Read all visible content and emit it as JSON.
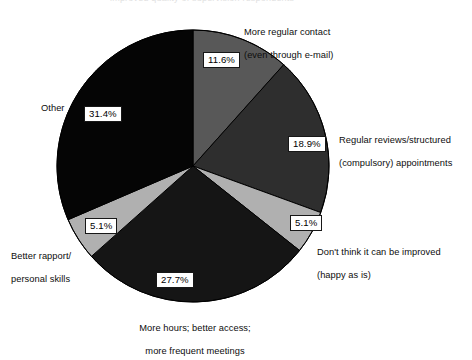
{
  "figure": {
    "title_remnant": "improved quality of supervision respondents",
    "background_color": "#ffffff",
    "geometry": {
      "center_x": 193,
      "center_y": 166,
      "radius": 136,
      "start_angle_deg": 0
    }
  },
  "chart_data": {
    "type": "pie",
    "title": "",
    "xlabel": "",
    "ylabel": "",
    "legend_position": "callout-labels",
    "grid": false,
    "units": "percent",
    "start_angle_deg": 0,
    "direction": "clockwise",
    "categories": [
      "More regular contact (even through e-mail)",
      "Regular reviews/structured (compulsory) appointments",
      "Don't think it can be improved (happy as is)",
      "More hours; better access; more frequent meetings",
      "Better rapport/personal skills",
      "Other"
    ],
    "values": [
      11.6,
      18.9,
      5.1,
      27.7,
      5.1,
      31.4
    ],
    "value_labels": [
      "11.6%",
      "18.9%",
      "5.1%",
      "27.7%",
      "5.1%",
      "31.4%"
    ],
    "colors": [
      "#585858",
      "#2e2e2e",
      "#b0b0b0",
      "#151515",
      "#b0b0b0",
      "#050505"
    ],
    "slices": [
      {
        "index": 0,
        "label": "More regular contact\n(even through e-mail)",
        "label_line1": "More regular contact",
        "label_line2": "(even through e-mail)",
        "value": 11.6,
        "value_label": "11.6%",
        "color": "#585858"
      },
      {
        "index": 1,
        "label": "Regular reviews/structured\n(compulsory) appointments",
        "label_line1": "Regular reviews/structured",
        "label_line2": "(compulsory) appointments",
        "value": 18.9,
        "value_label": "18.9%",
        "color": "#2e2e2e"
      },
      {
        "index": 2,
        "label": "Don't think it can be improved\n(happy as is)",
        "label_line1": "Don't think it can be improved",
        "label_line2": "(happy as is)",
        "value": 5.1,
        "value_label": "5.1%",
        "color": "#b0b0b0"
      },
      {
        "index": 3,
        "label": "More hours; better access;\nmore frequent meetings",
        "label_line1": "More hours; better access;",
        "label_line2": "more frequent meetings",
        "value": 27.7,
        "value_label": "27.7%",
        "color": "#151515"
      },
      {
        "index": 4,
        "label": "Better rapport/\npersonal skills",
        "label_line1": "Better rapport/",
        "label_line2": "personal skills",
        "value": 5.1,
        "value_label": "5.1%",
        "color": "#b0b0b0"
      },
      {
        "index": 5,
        "label": "Other",
        "label_line1": "Other",
        "label_line2": "",
        "value": 31.4,
        "value_label": "31.4%",
        "color": "#050505"
      }
    ]
  },
  "style": {
    "slice_outline_color": "#000000",
    "pct_box_fill": "#ffffff",
    "pct_box_border": "#171717",
    "text_color": "#0d0d0d"
  }
}
